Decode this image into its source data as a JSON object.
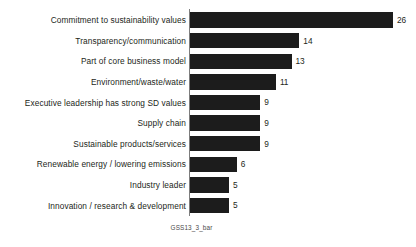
{
  "caption": "GSS13_3_bar",
  "colors": {
    "bar": "#1c1c1c",
    "axis": "#7d7d7d",
    "text": "#231f20",
    "background": "#ffffff"
  },
  "chart_data": {
    "type": "bar",
    "orientation": "horizontal",
    "title": "",
    "subtitle": "",
    "xlabel": "",
    "ylabel": "",
    "grid": false,
    "legend": false,
    "xlim": [
      0,
      26
    ],
    "value_labels": true,
    "categories": [
      "Commitment to sustainability values",
      "Transparency/communication",
      "Part of core business model",
      "Environment/waste/water",
      "Executive leadership has strong SD values",
      "Supply chain",
      "Sustainable products/services",
      "Renewable energy / lowering emissions",
      "Industry leader",
      "Innovation / research & development"
    ],
    "values": [
      26,
      14,
      13,
      11,
      9,
      9,
      9,
      6,
      5,
      5
    ]
  }
}
